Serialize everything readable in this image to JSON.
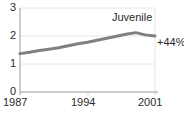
{
  "chart_data": {
    "type": "line",
    "title": "",
    "series_name": "Juvenile",
    "annotation": "+44%",
    "xlabel": "",
    "ylabel": "",
    "xlim": [
      1987,
      2001
    ],
    "ylim": [
      0,
      3
    ],
    "grid": true,
    "legend_position": "inline-top-right",
    "y_ticks": [
      "3",
      "2",
      "1",
      "0"
    ],
    "y_tick_values": [
      3,
      2,
      1,
      0
    ],
    "x_ticks": [
      "1987",
      "1994",
      "2001"
    ],
    "x_tick_values": [
      1987,
      1994,
      2001
    ],
    "line_color": "#808080",
    "axis_color": "#9a9a9a",
    "text_color": "#2b2b2b",
    "x": [
      1987,
      1988,
      1989,
      1990,
      1991,
      1992,
      1993,
      1994,
      1995,
      1996,
      1997,
      1998,
      1999,
      2000,
      2001
    ],
    "values": [
      1.37,
      1.42,
      1.48,
      1.53,
      1.58,
      1.65,
      1.72,
      1.78,
      1.85,
      1.92,
      1.99,
      2.06,
      2.12,
      2.04,
      2.0
    ]
  },
  "labels": {
    "y0": "0",
    "y1": "1",
    "y2": "2",
    "y3": "3",
    "x0": "1987",
    "x1": "1994",
    "x2": "2001",
    "series": "Juvenile",
    "change": "+44%"
  }
}
